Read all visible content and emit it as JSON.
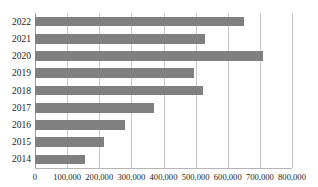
{
  "chart_data": {
    "type": "bar",
    "orientation": "horizontal",
    "title": "",
    "xlabel": "",
    "ylabel": "",
    "categories": [
      "2022",
      "2021",
      "2020",
      "2019",
      "2018",
      "2017",
      "2016",
      "2015",
      "2014"
    ],
    "values": [
      650000,
      530000,
      710000,
      495000,
      523000,
      370000,
      280000,
      215000,
      155000
    ],
    "xlim": [
      0,
      800000
    ],
    "xticks": [
      0,
      100000,
      200000,
      300000,
      400000,
      500000,
      600000,
      700000,
      800000
    ],
    "xtick_labels": [
      "0",
      "100,000",
      "200,000",
      "300,000",
      "400,000",
      "500,000",
      "600,000",
      "700,000",
      "800,000"
    ],
    "grid": true,
    "legend": false,
    "series": [
      {
        "name": "",
        "color": "#808080",
        "values": [
          650000,
          530000,
          710000,
          495000,
          523000,
          370000,
          280000,
          215000,
          155000
        ]
      }
    ]
  },
  "colors": {
    "bar": "#808080",
    "gridline": "#c9c9c9",
    "axis": "#9a9a9a",
    "background": "#ffffff",
    "text": "#1d1d1d"
  },
  "clipped_header": {
    "text": "—  —   —   — —   •  —  •  —     — —"
  }
}
